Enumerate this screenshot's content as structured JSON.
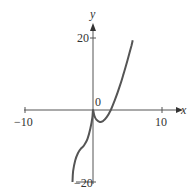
{
  "chart_data": {
    "type": "line",
    "title": "",
    "xlabel": "x",
    "ylabel": "y",
    "xlim": [
      -10,
      10
    ],
    "ylim": [
      -20,
      20
    ],
    "grid": false,
    "x_ticks": [
      "-10",
      "10"
    ],
    "y_ticks": [
      "20",
      "-20"
    ],
    "origin_label": "0",
    "series": [
      {
        "name": "curve",
        "color": "#555555",
        "x": [
          -3.0,
          -2.9,
          -2.6,
          -2.2,
          -1.8,
          -1.3,
          -0.8,
          -0.4,
          -0.1,
          0.0,
          0.2,
          0.5,
          1.0,
          1.5,
          2.0,
          2.6,
          3.2,
          3.8,
          4.4,
          5.0,
          5.6,
          5.8
        ],
        "y": [
          -20.0,
          -17.0,
          -14.0,
          -12.0,
          -10.8,
          -9.8,
          -8.0,
          -5.2,
          -2.2,
          0.0,
          -1.6,
          -2.7,
          -3.3,
          -3.0,
          -2.0,
          0.0,
          2.8,
          6.0,
          9.6,
          13.6,
          17.8,
          19.4
        ]
      }
    ]
  },
  "labels": {
    "x_axis": "x",
    "y_axis": "y",
    "origin": "0",
    "x_neg": "−10",
    "x_pos": "10",
    "y_pos": "20",
    "y_neg": "−20"
  }
}
